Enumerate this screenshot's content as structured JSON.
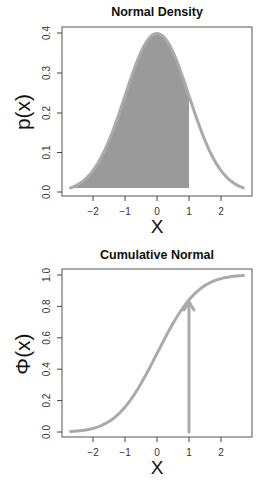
{
  "chart_data": [
    {
      "type": "area",
      "title": "Normal Density",
      "xlabel": "X",
      "ylabel": "p(x)",
      "xlim": [
        -2.75,
        2.75
      ],
      "ylim": [
        0,
        0.4
      ],
      "xticks": [
        -2,
        -1,
        0,
        1,
        2
      ],
      "yticks": [
        0.0,
        0.1,
        0.2,
        0.3,
        0.4
      ],
      "ytick_labels": [
        "0.0",
        "0.1",
        "0.2",
        "0.3",
        "0.4"
      ],
      "grid": false,
      "series": [
        {
          "name": "standard normal pdf",
          "function": "dnorm(x)",
          "x_range": [
            -2.7,
            2.7
          ],
          "color": "#aaaaaa"
        }
      ],
      "shaded_region": {
        "from": -2.7,
        "to": 1,
        "color": "#9a9a9a",
        "area": 0.841
      },
      "x": [
        -2.7,
        -2.5,
        -2,
        -1.5,
        -1,
        -0.5,
        0,
        0.5,
        1,
        1.5,
        2,
        2.5,
        2.7
      ],
      "values": [
        0.01,
        0.018,
        0.054,
        0.13,
        0.242,
        0.352,
        0.399,
        0.352,
        0.242,
        0.13,
        0.054,
        0.018,
        0.01
      ]
    },
    {
      "type": "line",
      "title": "Cumulative Normal",
      "xlabel": "X",
      "ylabel": "Φ(x)",
      "xlim": [
        -2.75,
        2.75
      ],
      "ylim": [
        0,
        1
      ],
      "xticks": [
        -2,
        -1,
        0,
        1,
        2
      ],
      "yticks": [
        0.0,
        0.2,
        0.4,
        0.6,
        0.8,
        1.0
      ],
      "ytick_labels": [
        "0.0",
        "0.2",
        "0.4",
        "0.6",
        "0.8",
        "1.0"
      ],
      "grid": false,
      "series": [
        {
          "name": "standard normal cdf",
          "function": "pnorm(x)",
          "x_range": [
            -2.7,
            2.7
          ],
          "color": "#aaaaaa"
        }
      ],
      "x": [
        -2.7,
        -2.5,
        -2,
        -1.5,
        -1,
        -0.5,
        0,
        0.5,
        1,
        1.5,
        2,
        2.5,
        2.7
      ],
      "values": [
        0.003,
        0.006,
        0.023,
        0.067,
        0.159,
        0.309,
        0.5,
        0.691,
        0.841,
        0.933,
        0.977,
        0.994,
        0.997
      ],
      "annotations": [
        {
          "type": "arrow",
          "x": 1,
          "from_y": 0,
          "to_y": 0.841,
          "color": "#aaaaaa"
        }
      ]
    }
  ],
  "charts": [
    {
      "title": "Normal Density",
      "xlabel": "X",
      "ylabel": "p(x)",
      "xtick_labels": [
        "−2",
        "−1",
        "0",
        "1",
        "2"
      ],
      "ytick_labels": [
        "0.0",
        "0.1",
        "0.2",
        "0.3",
        "0.4"
      ]
    },
    {
      "title": "Cumulative Normal",
      "xlabel": "X",
      "ylabel": "Φ(x)",
      "xtick_labels": [
        "−2",
        "−1",
        "0",
        "1",
        "2"
      ],
      "ytick_labels": [
        "0.0",
        "0.2",
        "0.4",
        "0.6",
        "0.8",
        "1.0"
      ]
    }
  ],
  "colors": {
    "curve": "#aaaaaa",
    "fill": "#9a9a9a",
    "axis": "#444444"
  }
}
